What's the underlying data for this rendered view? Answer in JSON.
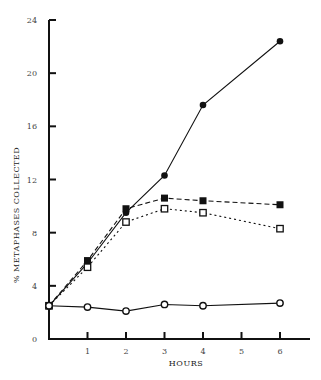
{
  "chart_data": {
    "type": "line",
    "title": "",
    "xlabel": "HOURS",
    "ylabel": "% METAPHASES COLLECTED",
    "x": [
      0,
      1,
      2,
      3,
      4,
      6
    ],
    "xticks": [
      1,
      2,
      3,
      4,
      5,
      6
    ],
    "yticks": [
      0,
      4,
      8,
      12,
      16,
      20,
      24
    ],
    "xlim": [
      0,
      6.5
    ],
    "ylim": [
      0,
      24
    ],
    "grid": false,
    "legend": "none",
    "series": [
      {
        "name": "filled-circle-solid",
        "marker": "filled-circle",
        "line": "solid",
        "values": [
          2.5,
          5.7,
          9.5,
          12.3,
          17.6,
          22.4
        ]
      },
      {
        "name": "filled-square-dashed",
        "marker": "filled-square",
        "line": "dashed",
        "values": [
          2.5,
          5.9,
          9.8,
          10.6,
          10.4,
          10.1
        ]
      },
      {
        "name": "open-square-dotted",
        "marker": "open-square",
        "line": "dotted",
        "values": [
          2.5,
          5.4,
          8.8,
          9.8,
          9.5,
          8.3
        ]
      },
      {
        "name": "open-circle-solid",
        "marker": "open-circle",
        "line": "solid",
        "values": [
          2.5,
          2.4,
          2.1,
          2.6,
          2.5,
          2.7
        ]
      }
    ]
  },
  "labels": {
    "xlabel": "HOURS",
    "ylabel": "% METAPHASES COLLECTED",
    "yticks": [
      "0",
      "4",
      "8",
      "12",
      "16",
      "20",
      "24"
    ],
    "xticks": [
      "1",
      "2",
      "3",
      "4",
      "5",
      "6"
    ]
  }
}
